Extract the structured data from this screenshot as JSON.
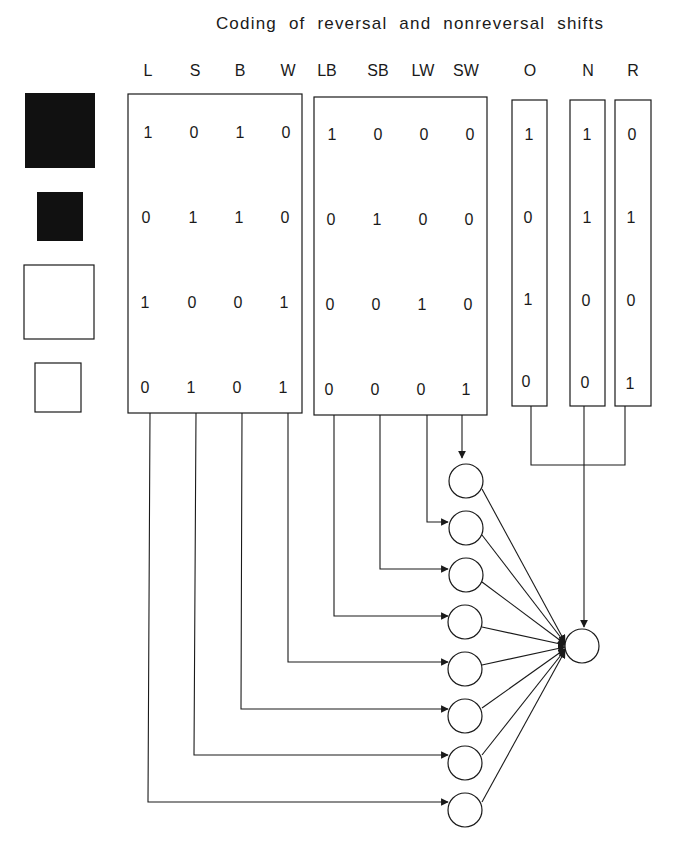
{
  "title": "Coding of reversal and nonreversal shifts",
  "stimuli": [
    {
      "name": "large-black-square",
      "size": "large",
      "color": "black",
      "fill": "#111111"
    },
    {
      "name": "small-black-square",
      "size": "small",
      "color": "black",
      "fill": "#111111"
    },
    {
      "name": "large-white-square",
      "size": "large",
      "color": "white",
      "fill": "#ffffff"
    },
    {
      "name": "small-white-square",
      "size": "small",
      "color": "white",
      "fill": "#ffffff"
    }
  ],
  "groups": [
    {
      "name": "single-dimension-inputs",
      "columns": [
        "L",
        "S",
        "B",
        "W"
      ],
      "rows": [
        [
          "1",
          "0",
          "1",
          "0"
        ],
        [
          "0",
          "1",
          "1",
          "0"
        ],
        [
          "1",
          "0",
          "0",
          "1"
        ],
        [
          "0",
          "1",
          "0",
          "1"
        ]
      ]
    },
    {
      "name": "conjunctive-inputs",
      "columns": [
        "LB",
        "SB",
        "LW",
        "SW"
      ],
      "rows": [
        [
          "1",
          "0",
          "0",
          "0"
        ],
        [
          "0",
          "1",
          "0",
          "0"
        ],
        [
          "0",
          "0",
          "1",
          "0"
        ],
        [
          "0",
          "0",
          "0",
          "1"
        ]
      ]
    },
    {
      "name": "shift-type-inputs",
      "columns": [
        "O",
        "N",
        "R"
      ],
      "rows": [
        [
          "1",
          "1",
          "0"
        ],
        [
          "0",
          "1",
          "1"
        ],
        [
          "1",
          "0",
          "0"
        ],
        [
          "0",
          "0",
          "1"
        ]
      ]
    }
  ],
  "network": {
    "hidden_units": 8,
    "output_units": 1,
    "hidden_inputs_top_to_bottom": [
      "SW",
      "LW",
      "SB",
      "LB",
      "W",
      "B",
      "S",
      "L"
    ],
    "output_inputs": [
      "all hidden units",
      "O",
      "N",
      "R"
    ]
  },
  "colors": {
    "ink": "#1a1a1a",
    "background": "#ffffff"
  }
}
